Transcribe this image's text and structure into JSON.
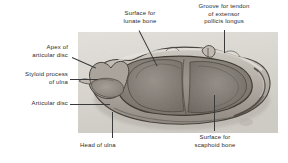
{
  "figure": {
    "kind": "anatomical-plate"
  },
  "labels": {
    "apex_of_articular_disc": "Apex of\narticular disc",
    "styloid_process_of_ulna": "Styloid process\nof ulna",
    "articular_disc": "Articular disc",
    "surface_for_lunate_bone": "Surface for\nlunate bone",
    "groove_for_tendon": "Groove for tendon\nof extensor\npollicis longus",
    "head_of_ulna": "Head of ulna",
    "surface_for_scaphoid_bone": "Surface for\nscaphoid bone"
  },
  "colors": {
    "background": "#ffffff",
    "text": "#2b2b2b",
    "leader": "#3a3a3a",
    "plate_paper": "#d9d6d0",
    "bone_mid": "#8f8a83",
    "bone_dark": "#4a453f",
    "bone_light": "#c2bdb5"
  }
}
